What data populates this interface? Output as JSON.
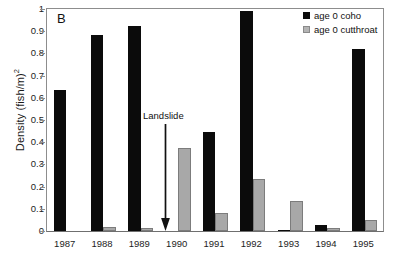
{
  "chart_data": {
    "type": "bar",
    "title": "",
    "panel_label": "B",
    "xlabel": "",
    "ylabel": "Density (fish/m)",
    "ylabel_exponent": "2",
    "categories": [
      "1987",
      "1988",
      "1989",
      "1990",
      "1991",
      "1992",
      "1993",
      "1994",
      "1995"
    ],
    "series": [
      {
        "name": "age 0 coho",
        "color": "#0b0b0b",
        "values": [
          0.635,
          0.885,
          0.925,
          0.0,
          0.445,
          0.99,
          0.005,
          0.025,
          0.82
        ]
      },
      {
        "name": "age 0 cutthroat",
        "color": "#a8a8a8",
        "values": [
          0.0,
          0.02,
          0.012,
          0.372,
          0.08,
          0.235,
          0.135,
          0.012,
          0.05
        ]
      }
    ],
    "ylim": [
      0,
      1
    ],
    "yticks": [
      0,
      0.1,
      0.2,
      0.3,
      0.4,
      0.5,
      0.6,
      0.7,
      0.8,
      0.9,
      1
    ],
    "ytick_labels": [
      "0",
      "0.1",
      "0.2",
      "0.3",
      "0.4",
      "0.5",
      "0.6",
      "0.7",
      "0.8",
      "0.9",
      "1"
    ],
    "grid": false,
    "legend_position": "top-right",
    "annotations": [
      {
        "text": "Landslide",
        "type": "arrow-down",
        "at_category": "1990"
      }
    ]
  }
}
